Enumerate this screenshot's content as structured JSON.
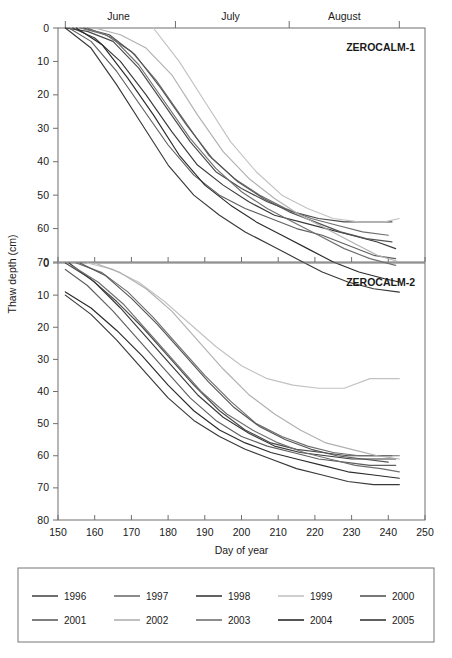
{
  "figure": {
    "y_axis_title": "Thaw depth (cm)",
    "x_axis_title": "Day of year",
    "months": [
      "June",
      "July",
      "August"
    ],
    "panels": [
      {
        "label": "ZEROCALM-1"
      },
      {
        "label": "ZEROCALM-2"
      }
    ]
  },
  "legend": {
    "entries": [
      {
        "label": "1996",
        "color": "#4a4a4a"
      },
      {
        "label": "1997",
        "color": "#6e6e6e"
      },
      {
        "label": "1998",
        "color": "#3a3a3a"
      },
      {
        "label": "1999",
        "color": "#c2c2c2"
      },
      {
        "label": "2000",
        "color": "#555555"
      },
      {
        "label": "2001",
        "color": "#5f5f5f"
      },
      {
        "label": "2002",
        "color": "#b0b0b0"
      },
      {
        "label": "2003",
        "color": "#707070"
      },
      {
        "label": "2004",
        "color": "#2a2a2a"
      },
      {
        "label": "2005",
        "color": "#383838"
      }
    ]
  },
  "chart_data": {
    "type": "line",
    "title": "",
    "xlabel": "Day of year",
    "ylabel": "Thaw depth (cm)",
    "xlim": [
      150,
      250
    ],
    "xticks": [
      150,
      160,
      170,
      180,
      190,
      200,
      210,
      220,
      230,
      240,
      250
    ],
    "grid": false,
    "y_inverted": true,
    "legend_position": "below-figure",
    "month_bands": [
      {
        "name": "June",
        "start": 152,
        "end": 181
      },
      {
        "name": "July",
        "start": 182,
        "end": 212
      },
      {
        "name": "August",
        "start": 213,
        "end": 243
      }
    ],
    "panels": [
      {
        "name": "ZEROCALM-1",
        "ylim": [
          0,
          70
        ],
        "yticks": [
          0,
          10,
          20,
          30,
          40,
          50,
          60,
          70
        ],
        "series": [
          {
            "name": "1996",
            "color": "#4a4a4a",
            "x": [
              152,
              158,
              165,
              172,
              179,
              186,
              193,
              200,
              207,
              214,
              221,
              228,
              235,
              241
            ],
            "y": [
              0,
              1,
              4,
              12,
              23,
              34,
              43,
              48,
              52,
              55,
              57,
              58,
              58,
              58
            ]
          },
          {
            "name": "1997",
            "color": "#6e6e6e",
            "x": [
              156,
              163,
              170,
              177,
              184,
              191,
              198,
              205,
              212,
              219,
              226,
              233,
              240
            ],
            "y": [
              0,
              2,
              7,
              16,
              27,
              38,
              45,
              50,
              54,
              57,
              59,
              61,
              62
            ]
          },
          {
            "name": "1998",
            "color": "#3a3a3a",
            "x": [
              154,
              160,
              167,
              174,
              181,
              188,
              195,
              202,
              209,
              216,
              223,
              230,
              237,
              242
            ],
            "y": [
              0,
              3,
              10,
              20,
              31,
              41,
              47,
              52,
              56,
              58,
              60,
              62,
              64,
              66
            ]
          },
          {
            "name": "1999",
            "color": "#c2c2c2",
            "x": [
              176,
              183,
              190,
              197,
              204,
              211,
              218,
              225,
              232,
              239,
              243
            ],
            "y": [
              0,
              10,
              22,
              34,
              43,
              50,
              54,
              57,
              58,
              58,
              57
            ]
          },
          {
            "name": "2000",
            "color": "#555555",
            "x": [
              157,
              164,
              171,
              178,
              185,
              192,
              199,
              206,
              213,
              220,
              227,
              234,
              241
            ],
            "y": [
              0,
              2,
              8,
              18,
              29,
              39,
              46,
              51,
              55,
              58,
              61,
              63,
              64
            ]
          },
          {
            "name": "2001",
            "color": "#5f5f5f",
            "x": [
              153,
              159,
              166,
              173,
              180,
              187,
              194,
              201,
              208,
              215,
              222,
              229,
              236,
              242
            ],
            "y": [
              0,
              4,
              13,
              24,
              35,
              44,
              50,
              54,
              57,
              60,
              62,
              65,
              68,
              69
            ]
          },
          {
            "name": "2002",
            "color": "#b0b0b0",
            "x": [
              160,
              167,
              174,
              181,
              188,
              195,
              202,
              209,
              216,
              223,
              230,
              237,
              243
            ],
            "y": [
              0,
              2,
              6,
              14,
              26,
              37,
              45,
              51,
              56,
              60,
              64,
              68,
              70
            ]
          },
          {
            "name": "2003",
            "color": "#707070",
            "x": [
              158,
              165,
              172,
              179,
              186,
              193,
              200,
              207,
              214,
              221,
              228,
              235,
              242
            ],
            "y": [
              0,
              3,
              11,
              22,
              33,
              42,
              49,
              54,
              58,
              62,
              66,
              69,
              71
            ]
          },
          {
            "name": "2004",
            "color": "#2a2a2a",
            "x": [
              155,
              162,
              169,
              176,
              183,
              190,
              197,
              204,
              211,
              218,
              225,
              232,
              239,
              243
            ],
            "y": [
              0,
              5,
              15,
              26,
              38,
              47,
              53,
              58,
              62,
              66,
              70,
              73,
              75,
              76
            ]
          },
          {
            "name": "2005",
            "color": "#383838",
            "x": [
              152,
              159,
              166,
              173,
              180,
              187,
              194,
              201,
              208,
              215,
              222,
              229,
              236,
              243
            ],
            "y": [
              0,
              6,
              17,
              29,
              41,
              50,
              56,
              61,
              65,
              69,
              73,
              76,
              78,
              79
            ]
          }
        ]
      },
      {
        "name": "ZEROCALM-2",
        "ylim": [
          0,
          80
        ],
        "yticks": [
          0,
          10,
          20,
          30,
          40,
          50,
          60,
          70,
          80
        ],
        "series": [
          {
            "name": "1996",
            "color": "#4a4a4a",
            "x": [
              152,
              159,
              166,
              173,
              180,
              187,
              194,
              201,
              208,
              215,
              222,
              229,
              236,
              241
            ],
            "y": [
              0,
              5,
              12,
              20,
              29,
              38,
              46,
              52,
              56,
              58,
              59,
              60,
              60,
              60
            ]
          },
          {
            "name": "1997",
            "color": "#6e6e6e",
            "x": [
              155,
              162,
              169,
              176,
              183,
              190,
              197,
              204,
              211,
              218,
              225,
              232,
              239,
              243
            ],
            "y": [
              0,
              3,
              9,
              17,
              26,
              35,
              43,
              50,
              54,
              57,
              59,
              60,
              60,
              60
            ]
          },
          {
            "name": "1998",
            "color": "#3a3a3a",
            "x": [
              153,
              160,
              167,
              174,
              181,
              188,
              195,
              202,
              209,
              216,
              223,
              230,
              237,
              242
            ],
            "y": [
              0,
              6,
              14,
              23,
              32,
              41,
              48,
              53,
              57,
              59,
              60,
              61,
              61,
              61
            ]
          },
          {
            "name": "1999",
            "color": "#c2c2c2",
            "x": [
              158,
              165,
              172,
              179,
              186,
              193,
              200,
              207,
              214,
              221,
              228,
              235,
              243
            ],
            "y": [
              0,
              2,
              6,
              12,
              19,
              26,
              32,
              36,
              38,
              39,
              39,
              36,
              36
            ]
          },
          {
            "name": "2000",
            "color": "#555555",
            "x": [
              156,
              163,
              170,
              177,
              184,
              191,
              198,
              205,
              212,
              219,
              226,
              233,
              240
            ],
            "y": [
              0,
              4,
              11,
              19,
              28,
              37,
              45,
              51,
              55,
              58,
              60,
              61,
              62
            ]
          },
          {
            "name": "2001",
            "color": "#5f5f5f",
            "x": [
              152,
              158,
              165,
              172,
              179,
              186,
              193,
              200,
              207,
              214,
              221,
              228,
              235,
              242
            ],
            "y": [
              2,
              7,
              15,
              24,
              33,
              42,
              49,
              54,
              57,
              59,
              61,
              62,
              63,
              63
            ]
          },
          {
            "name": "2002",
            "color": "#b0b0b0",
            "x": [
              160,
              167,
              174,
              181,
              188,
              195,
              202,
              209,
              216,
              223,
              230,
              237,
              243
            ],
            "y": [
              0,
              3,
              8,
              15,
              24,
              33,
              41,
              47,
              52,
              56,
              58,
              60,
              61
            ]
          },
          {
            "name": "2003",
            "color": "#707070",
            "x": [
              154,
              161,
              168,
              175,
              182,
              189,
              196,
              203,
              210,
              217,
              224,
              231,
              238,
              243
            ],
            "y": [
              1,
              6,
              13,
              22,
              31,
              40,
              47,
              52,
              56,
              59,
              61,
              63,
              64,
              65
            ]
          },
          {
            "name": "2004",
            "color": "#2a2a2a",
            "x": [
              152,
              159,
              166,
              173,
              180,
              187,
              194,
              201,
              208,
              215,
              222,
              229,
              236,
              243
            ],
            "y": [
              9,
              14,
              21,
              29,
              38,
              46,
              52,
              56,
              59,
              61,
              63,
              65,
              66,
              67
            ]
          },
          {
            "name": "2005",
            "color": "#383838",
            "x": [
              152,
              159,
              166,
              173,
              180,
              187,
              194,
              201,
              208,
              215,
              222,
              229,
              236,
              243
            ],
            "y": [
              10,
              16,
              24,
              33,
              42,
              49,
              54,
              58,
              61,
              64,
              66,
              68,
              69,
              69
            ]
          }
        ]
      }
    ]
  }
}
